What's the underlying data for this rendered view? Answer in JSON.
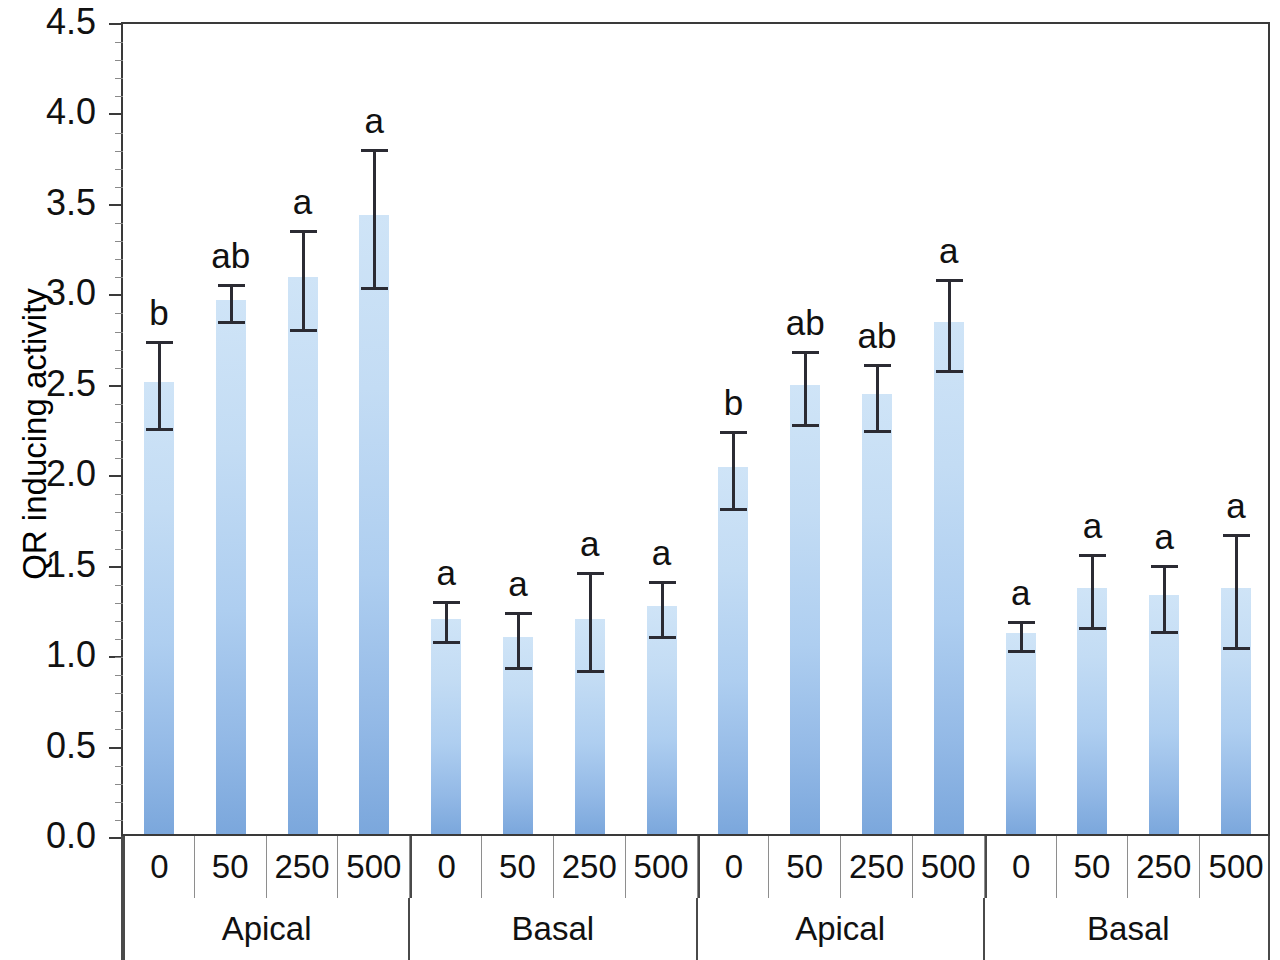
{
  "chart_data": {
    "type": "bar",
    "title": "",
    "xlabel": "",
    "ylabel": "QR inducing activity",
    "ylim": [
      0.0,
      4.5
    ],
    "ytick_labels": [
      "4.5",
      "4.0",
      "3.5",
      "3.0",
      "2.5",
      "2.0",
      "1.5",
      "1.0",
      "0.5",
      "0.0"
    ],
    "ytick_values": [
      4.5,
      4.0,
      3.5,
      3.0,
      2.5,
      2.0,
      1.5,
      1.0,
      0.5,
      0.0
    ],
    "grid": false,
    "legend": "none",
    "bar_color_top": "#cfe4f7",
    "bar_color_bottom": "#7ba7dc",
    "error_bar_color": "#2b2b33",
    "categories": [
      "0",
      "50",
      "250",
      "500",
      "0",
      "50",
      "250",
      "500",
      "0",
      "50",
      "250",
      "500",
      "0",
      "50",
      "250",
      "500"
    ],
    "group_labels": [
      "Apical",
      "Basal",
      "Apical",
      "Basal"
    ],
    "group_size": 4,
    "values": [
      2.5,
      2.95,
      3.08,
      3.42,
      1.19,
      1.09,
      1.19,
      1.26,
      2.03,
      2.48,
      2.43,
      2.83,
      1.11,
      1.36,
      1.32,
      1.36
    ],
    "errors": [
      0.25,
      0.11,
      0.28,
      0.39,
      0.12,
      0.16,
      0.28,
      0.16,
      0.22,
      0.21,
      0.19,
      0.26,
      0.09,
      0.21,
      0.19,
      0.32
    ],
    "annotations": [
      "b",
      "ab",
      "a",
      "a",
      "a",
      "a",
      "a",
      "a",
      "b",
      "ab",
      "ab",
      "a",
      "a",
      "a",
      "a",
      "a"
    ]
  }
}
